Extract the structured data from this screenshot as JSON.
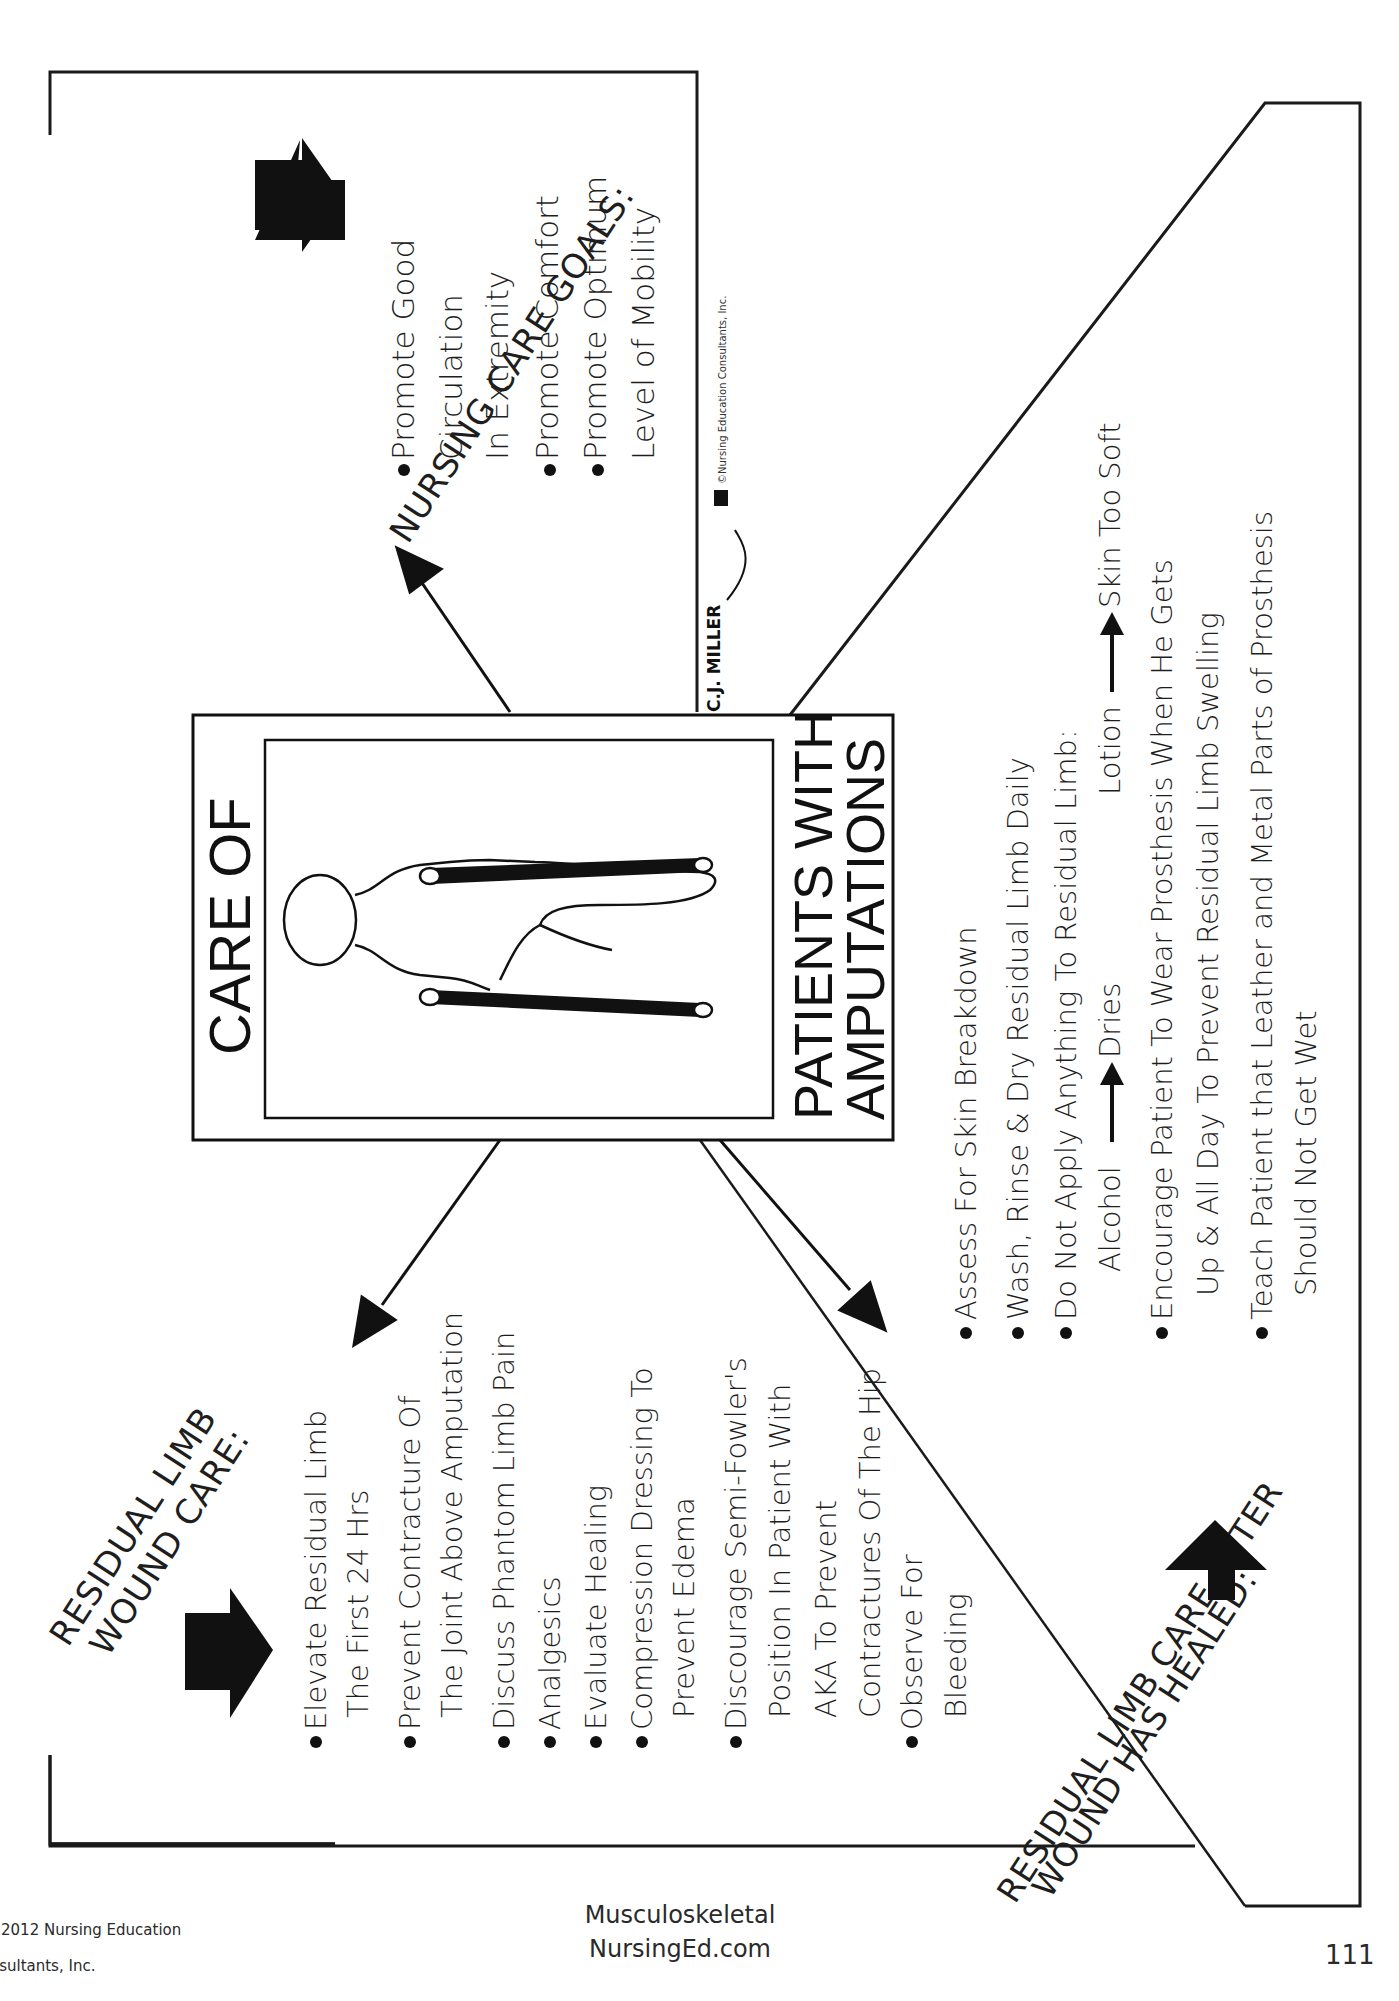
{
  "center_card": {
    "title_top": "CARE OF",
    "title_bottom_line1": "PATIENTS WITH",
    "title_bottom_line2": "AMPUTATIONS"
  },
  "signature": "C.J. MILLER",
  "copyright_badge": "NEC",
  "copyright_text": "©Nursing Education Consultants, Inc.",
  "nursing_goals": {
    "heading": "NURSING CARE GOALS:",
    "items": [
      [
        "Promote Good",
        "Circulation",
        "In Extremity"
      ],
      [
        "Promote Comfort"
      ],
      [
        "Promote Optimum",
        "Level of Mobility"
      ]
    ]
  },
  "wound_care": {
    "heading_line1": "RESIDUAL LIMB",
    "heading_line2": "WOUND CARE:",
    "items": [
      [
        "Elevate Residual Limb",
        "The First 24 Hrs"
      ],
      [
        "Prevent Contracture Of",
        "The Joint Above Amputation"
      ],
      [
        "Discuss Phantom Limb Pain"
      ],
      [
        "Analgesics"
      ],
      [
        "Evaluate Healing"
      ],
      [
        "Compression Dressing To",
        "Prevent Edema"
      ],
      [
        "Discourage Semi-Fowler's",
        "Position In Patient With",
        "AKA To Prevent",
        "Contractures Of The Hip"
      ],
      [
        "Observe For",
        "Bleeding"
      ]
    ]
  },
  "after_healed": {
    "heading_line1": "RESIDUAL LIMB CARE AFTER",
    "heading_line2": "WOUND HAS HEALED:",
    "items": [
      [
        "Assess For Skin Breakdown"
      ],
      [
        "Wash, Rinse & Dry Residual Limb Daily"
      ],
      [
        "Do Not Apply Anything To Residual Limb:"
      ],
      [
        "Encourage Patient To Wear Prosthesis When He Gets",
        "Up & All Day To Prevent Residual Limb Swelling"
      ],
      [
        "Teach Patient that Leather and Metal Parts of Prosthesis",
        "Should Not Get Wet"
      ]
    ],
    "alcohol": "Alcohol",
    "alcohol_effect": "Dries",
    "lotion": "Lotion",
    "lotion_effect": "Skin Too Soft"
  },
  "footer": {
    "left_line1": "©2012 Nursing Education",
    "left_line2": "Consultants, Inc.",
    "center_line1": "Musculoskeletal",
    "center_line2": "NursingEd.com",
    "page_number": "111"
  }
}
